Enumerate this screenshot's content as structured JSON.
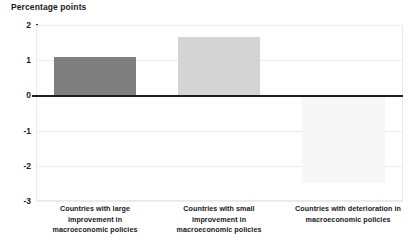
{
  "chart_data": {
    "type": "bar",
    "title": "Percentage points",
    "xlabel": "",
    "ylabel": "Percentage points",
    "categories": [
      "Countries with large improvement in macroeconomic policies",
      "Countries with small improvement in macroeconomic policies",
      "Countries with deterioration in macroeconomic policies"
    ],
    "values": [
      1.1,
      1.65,
      -2.5
    ],
    "ylim": [
      -3,
      2
    ],
    "yticks": [
      2,
      1,
      0,
      -1,
      -2,
      -3
    ],
    "ytick_labels": [
      "2",
      "1",
      "0",
      "-1",
      "-2",
      "-3"
    ],
    "grid": true,
    "legend": false,
    "bar_colors": [
      "#7f7f7f",
      "#d4d4d4",
      "#f7f7f7"
    ],
    "zero_line_color": "#1c1c22",
    "gridline_color": "#ececec"
  },
  "axis": {
    "title": "Percentage points",
    "ticks": [
      {
        "label": "2",
        "value": 2
      },
      {
        "label": "1",
        "value": 1
      },
      {
        "label": "0",
        "value": 0
      },
      {
        "label": "-1",
        "value": -1
      },
      {
        "label": "-2",
        "value": -2
      },
      {
        "label": "-3",
        "value": -3
      }
    ]
  },
  "categories": [
    {
      "id": "large-improvement",
      "line1": "Countries with large",
      "line2": "improvement in",
      "line3": "macroeconomic policies",
      "value": 1.1
    },
    {
      "id": "small-improvement",
      "line1": "Countries with small",
      "line2": "improvement in",
      "line3": "macroeconomic policies",
      "value": 1.65
    },
    {
      "id": "deterioration",
      "line1": "Countries with deterioration in",
      "line2": "macroeconomic policies",
      "line3": "",
      "value": -2.5
    }
  ]
}
